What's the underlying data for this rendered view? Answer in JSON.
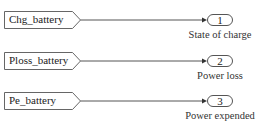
{
  "diagram": {
    "type": "simulink-subsystem",
    "rows": [
      {
        "from_tag": "Chg_battery",
        "outport_number": "1",
        "outport_label": "State of charge"
      },
      {
        "from_tag": "Ploss_battery",
        "outport_number": "2",
        "outport_label": "Power loss"
      },
      {
        "from_tag": "Pe_battery",
        "outport_number": "3",
        "outport_label": "Power expended"
      }
    ],
    "colors": {
      "stroke": "#555555",
      "text": "#222222",
      "background": "#ffffff"
    }
  }
}
